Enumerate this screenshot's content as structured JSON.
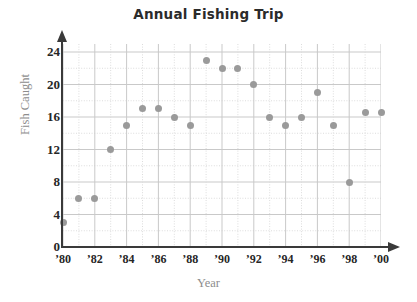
{
  "chart_data": {
    "type": "scatter",
    "title": "Annual Fishing Trip",
    "xlabel": "Year",
    "ylabel": "Fish Caught",
    "grid": true,
    "legend": "none",
    "xlim": [
      1980,
      2000
    ],
    "ylim": [
      0,
      25
    ],
    "y_ticks": [
      0,
      4,
      8,
      12,
      16,
      20,
      24
    ],
    "y_tick_labels": [
      "0",
      "4",
      "8",
      "12",
      "16",
      "20",
      "24"
    ],
    "x_ticks": [
      1980,
      1982,
      1984,
      1986,
      1988,
      1990,
      1992,
      1994,
      1996,
      1998,
      2000
    ],
    "x_tick_labels": [
      "’80",
      "’82",
      "’84",
      "’86",
      "’88",
      "’90",
      "’92",
      "’94",
      "’96",
      "’98",
      "’00"
    ],
    "x": [
      1980,
      1981,
      1982,
      1983,
      1984,
      1985,
      1986,
      1987,
      1988,
      1989,
      1990,
      1991,
      1992,
      1993,
      1994,
      1995,
      1996,
      1997,
      1998,
      1999,
      2000
    ],
    "values": [
      3,
      6,
      6,
      12,
      15,
      17,
      17,
      16,
      15,
      23,
      22,
      22,
      20,
      16,
      15,
      16,
      19,
      15,
      8,
      16.5,
      16.5
    ],
    "point_color": "#9a9a9a",
    "grid_color": "#c9c9c9",
    "axis_color": "#3a3a3a"
  }
}
